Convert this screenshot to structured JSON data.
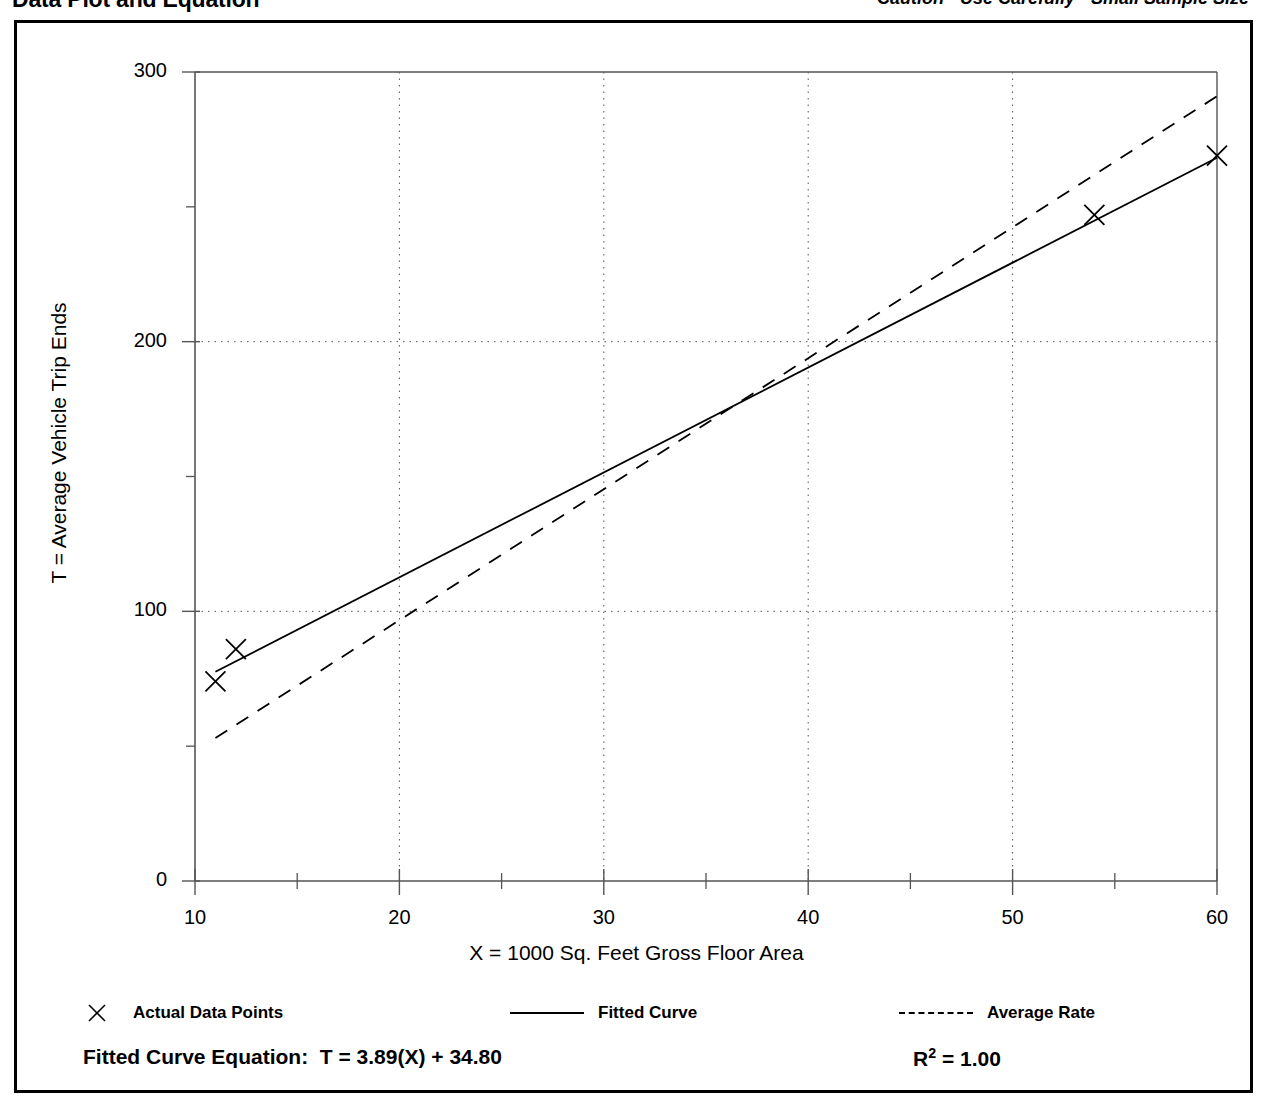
{
  "header": {
    "title": "Data Plot and Equation",
    "caution": "Caution - Use Carefully - Small Sample Size"
  },
  "legend": {
    "items": [
      {
        "label": "Actual Data Points",
        "swatch": "x-marker"
      },
      {
        "label": "Fitted Curve",
        "swatch": "solid-line"
      },
      {
        "label": "Average Rate",
        "swatch": "dashed-line"
      }
    ]
  },
  "footer": {
    "equation_label": "Fitted Curve Equation:",
    "equation": "T = 3.89(X) + 34.80",
    "r2_label": "R",
    "r2_exponent": "2",
    "r2_value": "= 1.00"
  },
  "chart_data": {
    "type": "scatter",
    "title": "",
    "xlabel": "X = 1000 Sq. Feet Gross Floor Area",
    "ylabel": "T = Average Vehicle Trip Ends",
    "xlim": [
      10,
      60
    ],
    "ylim": [
      0,
      300
    ],
    "xticks": [
      10,
      20,
      30,
      40,
      50,
      60
    ],
    "xtick_labels": [
      "10",
      "20",
      "30",
      "40",
      "50",
      "60"
    ],
    "xminor_ticks": [
      15,
      25,
      35,
      45,
      55
    ],
    "yticks": [
      0,
      100,
      200,
      300
    ],
    "ytick_labels": [
      "0",
      "100",
      "200",
      "300"
    ],
    "yminor_ticks": [
      50,
      150,
      250
    ],
    "grid": "dotted major gridlines at x=20,30,40,50 and y=100,200",
    "gridlines_x": [
      20,
      30,
      40,
      50
    ],
    "gridlines_y": [
      100,
      200
    ],
    "legend_position": "below-plot",
    "series": [
      {
        "name": "Actual Data Points",
        "type": "scatter",
        "marker": "x",
        "points": [
          {
            "x": 11,
            "y": 74
          },
          {
            "x": 12,
            "y": 86
          },
          {
            "x": 54,
            "y": 247
          },
          {
            "x": 60,
            "y": 269
          }
        ]
      },
      {
        "name": "Fitted Curve",
        "type": "line",
        "style": "solid",
        "equation": "T = 3.89(X) + 34.80",
        "slope": 3.89,
        "intercept": 34.8,
        "r_squared": 1.0,
        "endpoints": [
          {
            "x": 11,
            "y": 77.6
          },
          {
            "x": 60,
            "y": 268.2
          }
        ]
      },
      {
        "name": "Average Rate",
        "type": "line",
        "style": "dashed",
        "endpoints": [
          {
            "x": 11,
            "y": 53
          },
          {
            "x": 60,
            "y": 291
          }
        ]
      }
    ]
  }
}
